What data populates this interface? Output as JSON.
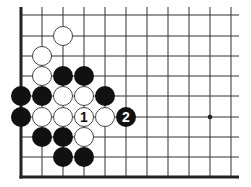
{
  "diagram": {
    "type": "go-board-fragment",
    "grid": {
      "columns_x": [
        21,
        42,
        63,
        84,
        105,
        126,
        147,
        168,
        189,
        210,
        231
      ],
      "rows_y": [
        15,
        36,
        56,
        76,
        96,
        117,
        137,
        157,
        177
      ],
      "right_extent": 239,
      "top_extent": 15,
      "left_edge_thick": true,
      "bottom_edge_thick": true
    },
    "star_points": [
      {
        "col": 9,
        "row": 5
      }
    ],
    "stones": [
      {
        "col": 2,
        "row": 1,
        "color": "white",
        "label": ""
      },
      {
        "col": 1,
        "row": 2,
        "color": "white",
        "label": ""
      },
      {
        "col": 1,
        "row": 3,
        "color": "white",
        "label": ""
      },
      {
        "col": 2,
        "row": 3,
        "color": "black",
        "label": ""
      },
      {
        "col": 3,
        "row": 3,
        "color": "black",
        "label": ""
      },
      {
        "col": 0,
        "row": 4,
        "color": "black",
        "label": ""
      },
      {
        "col": 1,
        "row": 4,
        "color": "black",
        "label": ""
      },
      {
        "col": 2,
        "row": 4,
        "color": "white",
        "label": ""
      },
      {
        "col": 3,
        "row": 4,
        "color": "white",
        "label": ""
      },
      {
        "col": 4,
        "row": 4,
        "color": "black",
        "label": ""
      },
      {
        "col": 0,
        "row": 5,
        "color": "black",
        "label": ""
      },
      {
        "col": 1,
        "row": 5,
        "color": "white",
        "label": ""
      },
      {
        "col": 2,
        "row": 5,
        "color": "white",
        "label": ""
      },
      {
        "col": 3,
        "row": 5,
        "color": "white",
        "label": "1"
      },
      {
        "col": 4,
        "row": 5,
        "color": "white",
        "label": ""
      },
      {
        "col": 5,
        "row": 5,
        "color": "black",
        "label": "2"
      },
      {
        "col": 1,
        "row": 6,
        "color": "black",
        "label": ""
      },
      {
        "col": 2,
        "row": 6,
        "color": "black",
        "label": ""
      },
      {
        "col": 3,
        "row": 6,
        "color": "white",
        "label": ""
      },
      {
        "col": 2,
        "row": 7,
        "color": "black",
        "label": ""
      },
      {
        "col": 3,
        "row": 7,
        "color": "black",
        "label": ""
      }
    ],
    "colors": {
      "background": "#ffffff",
      "line": "#333333",
      "edge": "#222222",
      "black_stone": "#111111",
      "white_stone": "#ffffff",
      "white_stone_border": "#444444"
    }
  }
}
